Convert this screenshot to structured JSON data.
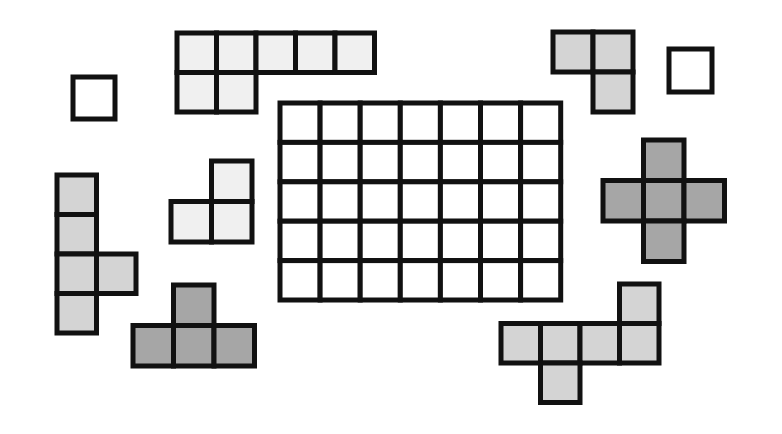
{
  "diagram": {
    "colors": {
      "background": "#ffffff",
      "stroke": "#111111",
      "white": "#ffffff",
      "light": "#f0f0f0",
      "medium": "#d4d4d4",
      "dark": "#a6a6a6"
    },
    "grid": {
      "name": "main-grid",
      "x": 280,
      "y": 103,
      "cols": 7,
      "rows": 5,
      "cell_w": 40.1,
      "cell_h": 39.4,
      "fill": "white"
    },
    "pieces": [
      {
        "name": "piece-top-left-heptomino",
        "x": 177,
        "y": 33,
        "cell": 39.5,
        "fill": "light",
        "cells": [
          [
            0,
            0
          ],
          [
            1,
            0
          ],
          [
            2,
            0
          ],
          [
            3,
            0
          ],
          [
            4,
            0
          ],
          [
            0,
            1
          ],
          [
            1,
            1
          ]
        ]
      },
      {
        "name": "piece-single-left",
        "x": 73,
        "y": 77,
        "cell": 42,
        "fill": "white",
        "cells": [
          [
            0,
            0
          ]
        ]
      },
      {
        "name": "piece-top-right-tromino",
        "x": 553,
        "y": 32,
        "cell": 40,
        "fill": "medium",
        "cells": [
          [
            0,
            0
          ],
          [
            1,
            0
          ],
          [
            1,
            1
          ]
        ]
      },
      {
        "name": "piece-single-right",
        "x": 669,
        "y": 49,
        "cell": 43,
        "fill": "white",
        "cells": [
          [
            0,
            0
          ]
        ]
      },
      {
        "name": "piece-left-y-pentomino",
        "x": 57,
        "y": 175,
        "cell": 39.5,
        "fill": "medium",
        "cells": [
          [
            0,
            0
          ],
          [
            0,
            1
          ],
          [
            0,
            2
          ],
          [
            1,
            2
          ],
          [
            0,
            3
          ]
        ]
      },
      {
        "name": "piece-small-l-tromino",
        "x": 171,
        "y": 161,
        "cell": 40.5,
        "fill": "light",
        "cells": [
          [
            1,
            0
          ],
          [
            0,
            1
          ],
          [
            1,
            1
          ]
        ]
      },
      {
        "name": "piece-t-tetromino",
        "x": 133,
        "y": 285,
        "cell": 40.5,
        "fill": "dark",
        "cells": [
          [
            1,
            0
          ],
          [
            0,
            1
          ],
          [
            1,
            1
          ],
          [
            2,
            1
          ]
        ]
      },
      {
        "name": "piece-plus-pentomino",
        "x": 603,
        "y": 140,
        "cell": 40.5,
        "fill": "dark",
        "cells": [
          [
            1,
            0
          ],
          [
            0,
            1
          ],
          [
            1,
            1
          ],
          [
            2,
            1
          ],
          [
            1,
            2
          ]
        ]
      },
      {
        "name": "piece-bottom-right-hexomino",
        "x": 501,
        "y": 284,
        "cell": 39.5,
        "fill": "medium",
        "cells": [
          [
            3,
            0
          ],
          [
            0,
            1
          ],
          [
            1,
            1
          ],
          [
            2,
            1
          ],
          [
            3,
            1
          ],
          [
            1,
            2
          ]
        ]
      }
    ]
  }
}
